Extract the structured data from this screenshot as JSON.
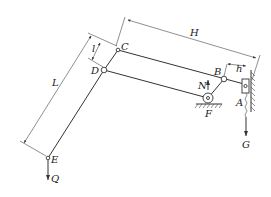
{
  "diagram": {
    "points": {
      "A": "A",
      "B": "B",
      "C": "C",
      "D": "D",
      "E": "E",
      "F": "F"
    },
    "forces": {
      "G": "G",
      "Q": "Q",
      "N": "N"
    },
    "dimensions": {
      "H": "H",
      "L": "L",
      "l": "l",
      "h": "h"
    },
    "colors": {
      "line": "#333333",
      "background": "#ffffff"
    }
  }
}
